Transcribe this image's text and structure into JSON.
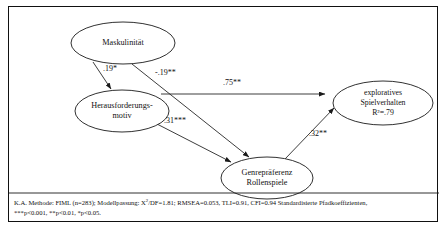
{
  "figure": {
    "type": "path-diagram",
    "nodes": [
      {
        "id": "maskulinitaet",
        "lines": [
          "Maskulinität"
        ],
        "cx": 114,
        "cy": 36,
        "rx": 52,
        "ry": 21
      },
      {
        "id": "herausforderungsmotiv",
        "lines": [
          "Herausforderungs-",
          "motiv"
        ],
        "cx": 113,
        "cy": 104,
        "rx": 47,
        "ry": 21
      },
      {
        "id": "genrepraeferenz",
        "lines": [
          "Genrepräferenz",
          "Rollenspiele"
        ],
        "cx": 258,
        "cy": 171,
        "rx": 46,
        "ry": 21
      },
      {
        "id": "exploratives-spielverhalten",
        "lines": [
          "exploratives",
          "Spielverhalten",
          "R²=.79"
        ],
        "cx": 374,
        "cy": 96,
        "rx": 50,
        "ry": 22
      }
    ],
    "paths": [
      {
        "id": "mask-to-herausforderung",
        "from": "maskulinitaet",
        "to": "herausforderungsmotiv",
        "coefficient": ".19*",
        "label_x": 94,
        "label_y": 62,
        "x1": 84,
        "y1": 55,
        "x2": 102,
        "y2": 82
      },
      {
        "id": "mask-to-genrepraeferenz",
        "from": "maskulinitaet",
        "to": "genrepraeferenz",
        "coefficient": "-.19**",
        "label_x": 146,
        "label_y": 66,
        "x1": 123,
        "y1": 57,
        "x2": 240,
        "y2": 150
      },
      {
        "id": "herausforderung-to-exploratives",
        "from": "herausforderungsmotiv",
        "to": "exploratives-spielverhalten",
        "coefficient": ".75**",
        "label_x": 214,
        "label_y": 76,
        "x1": 152,
        "y1": 87,
        "x2": 316,
        "y2": 87
      },
      {
        "id": "herausforderung-to-genrepraeferenz",
        "from": "herausforderungsmotiv",
        "to": "genrepraeferenz",
        "coefficient": ".31***",
        "label_x": 155,
        "label_y": 114,
        "x1": 148,
        "y1": 117,
        "x2": 222,
        "y2": 155
      },
      {
        "id": "genrepraeferenz-to-exploratives",
        "from": "genrepraeferenz",
        "to": "exploratives-spielverhalten",
        "coefficient": ".32**",
        "label_x": 300,
        "label_y": 127,
        "x1": 276,
        "y1": 152,
        "x2": 325,
        "y2": 101
      }
    ],
    "notes": {
      "divider_y": 186,
      "line1_prefix": "K.A. Methode: FIML (n=283); Modellpassung:  X",
      "line1_sup": "2",
      "line1_rest": "/DF=1.81; RMSEA=0.053, TLI=0.91, CFI=0.94  Standardisierte Pfadkoeffizienten,",
      "line2": "***p<0.001, **p<0.01, *p<0.05."
    }
  }
}
